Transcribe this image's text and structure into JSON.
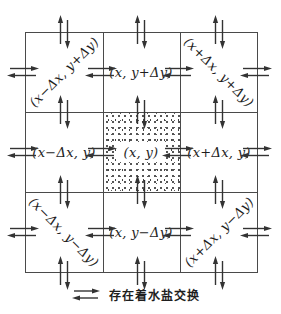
{
  "cells": [
    {
      "id": "top-left",
      "label": "(x−Δx, y+Δy)",
      "orientation": "diagonal-up"
    },
    {
      "id": "top-center",
      "label": "(x, y+Δy)",
      "orientation": "horizontal"
    },
    {
      "id": "top-right",
      "label": "(x+Δx, y+Δy)",
      "orientation": "diagonal-down"
    },
    {
      "id": "middle-left",
      "label": "(x−Δx, y)",
      "orientation": "horizontal"
    },
    {
      "id": "center",
      "label": "(x, y)",
      "orientation": "horizontal"
    },
    {
      "id": "middle-right",
      "label": "(x+Δx, y)",
      "orientation": "horizontal"
    },
    {
      "id": "bottom-left",
      "label": "(x−Δx, y−Δy)",
      "orientation": "diagonal-down"
    },
    {
      "id": "bottom-center",
      "label": "(x, y−Δy)",
      "orientation": "horizontal"
    },
    {
      "id": "bottom-right",
      "label": "(x+Δx, y−Δy)",
      "orientation": "diagonal-up"
    }
  ],
  "legend": {
    "icon": "double-arrow-exchange-icon",
    "label": "存在着水盐交换"
  },
  "icons": {
    "exchange_pair": "water-salt-exchange-arrows-icon"
  },
  "colors": {
    "line": "#4a4a4a",
    "arrow": "#333333",
    "text": "#1e1e1e",
    "background": "#ffffff"
  }
}
